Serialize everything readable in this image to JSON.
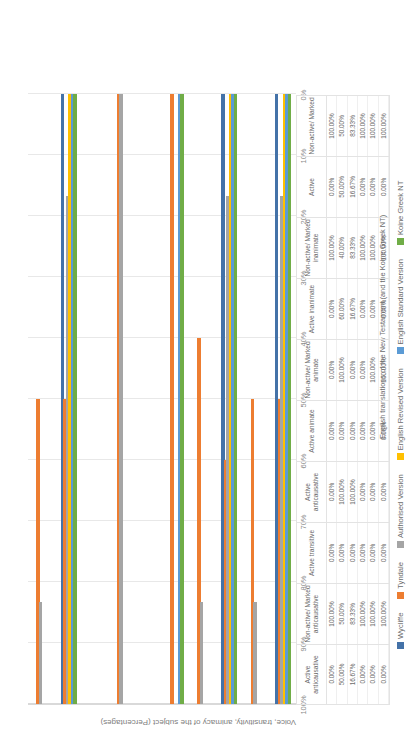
{
  "chart_data": {
    "type": "bar",
    "orientation": "horizontal",
    "title": "",
    "xlabel": "English translations of the New Testament (and the Koine Greek NT)",
    "ylabel": "Voice, transitivity, animacy of the subject (Percentages)",
    "ylim": [
      0,
      100
    ],
    "yticks": [
      "0%",
      "10%",
      "20%",
      "30%",
      "40%",
      "50%",
      "60%",
      "70%",
      "80%",
      "90%",
      "100%"
    ],
    "grid": true,
    "legend_position": "bottom",
    "categories": [
      "Active anticausative",
      "Non-active/ Marked anticausative",
      "Active transitive",
      "Active anticausative",
      "Active animate",
      "Non-active/ Marked animate",
      "Active inanimate",
      "Non-active/ Marked inanimate",
      "Active",
      "Non-active/ Marked"
    ],
    "series": [
      {
        "name": "Wycliffe",
        "color": "#4472a8",
        "values": [
          0,
          100,
          0,
          0,
          0,
          0,
          0,
          100,
          0,
          100
        ]
      },
      {
        "name": "Tyndale",
        "color": "#ed7d31",
        "values": [
          50,
          50,
          0,
          100,
          0,
          100,
          60,
          40,
          50,
          50
        ]
      },
      {
        "name": "Authorised Version",
        "color": "#a5a5a5",
        "values": [
          16.67,
          83.33,
          0,
          100,
          0,
          0,
          16.67,
          83.33,
          16.67,
          83.33
        ]
      },
      {
        "name": "English Revised Version",
        "color": "#ffc000",
        "values": [
          0,
          100,
          0,
          0,
          0,
          0,
          0,
          100,
          0,
          100
        ]
      },
      {
        "name": "English Standard Version",
        "color": "#5b9bd5",
        "values": [
          0,
          100,
          0,
          0,
          0,
          100,
          0,
          100,
          0,
          100
        ]
      },
      {
        "name": "Koine Greek NT",
        "color": "#70ad47",
        "values": [
          0,
          100,
          0,
          0,
          0,
          100,
          0,
          100,
          0,
          100
        ]
      }
    ],
    "data_table": {
      "columns": [
        "Active anticausative",
        "Non-active/ Marked anticausative",
        "Active transitive",
        "Active anticausative",
        "Active animate",
        "Non-active/ Marked animate",
        "Active inanimate",
        "Non-active/ Marked inanimate",
        "Active",
        "Non-active/ Marked"
      ],
      "rows": [
        {
          "name": "Wycliffe",
          "color": "#4472a8",
          "cells": [
            "0.00%",
            "100.00%",
            "0.00%",
            "0.00%",
            "0.00%",
            "0.00%",
            "0.00%",
            "100.00%",
            "0.00%",
            "100.00%"
          ]
        },
        {
          "name": "Tyndale",
          "color": "#ed7d31",
          "cells": [
            "50.00%",
            "50.00%",
            "0.00%",
            "100.00%",
            "0.00%",
            "100.00%",
            "60.00%",
            "40.00%",
            "50.00%",
            "50.00%"
          ]
        },
        {
          "name": "Authorised Version",
          "color": "#a5a5a5",
          "cells": [
            "16.67%",
            "83.33%",
            "0.00%",
            "100.00%",
            "0.00%",
            "0.00%",
            "16.67%",
            "83.33%",
            "16.67%",
            "83.33%"
          ]
        },
        {
          "name": "English Revised Version",
          "color": "#ffc000",
          "cells": [
            "0.00%",
            "100.00%",
            "0.00%",
            "0.00%",
            "0.00%",
            "0.00%",
            "0.00%",
            "100.00%",
            "0.00%",
            "100.00%"
          ]
        },
        {
          "name": "English Standard Version",
          "color": "#5b9bd5",
          "cells": [
            "0.00%",
            "100.00%",
            "0.00%",
            "0.00%",
            "0.00%",
            "100.00%",
            "0.00%",
            "100.00%",
            "0.00%",
            "100.00%"
          ]
        },
        {
          "name": "Koine Greek NT",
          "color": "#70ad47",
          "cells": [
            "0.00%",
            "100.00%",
            "0.00%",
            "0.00%",
            "0.00%",
            "100.00%",
            "0.00%",
            "100.00%",
            "0.00%",
            "100.00%"
          ]
        }
      ]
    }
  }
}
